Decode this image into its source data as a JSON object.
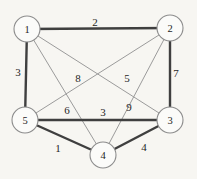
{
  "colors": {
    "background": "#f7f6f2",
    "node_fill": "#fbfbf9",
    "node_stroke": "#8c8c8c",
    "edge_thick": "#3f3f3f",
    "edge_thin": "#9b9b9b",
    "label_text": "#1f1f1f"
  },
  "diagram": {
    "type": "weighted-undirected-graph",
    "node_radius": 13,
    "node_stroke_width": 1.1,
    "node_label_font_size": 10.5,
    "weight_label_font_size": 11,
    "edge_styles": {
      "thick": {
        "color": "#3f3f3f",
        "width": 2.4
      },
      "thin": {
        "color": "#9b9b9b",
        "width": 1
      }
    },
    "nodes": [
      {
        "id": "1",
        "x": 27,
        "y": 29
      },
      {
        "id": "2",
        "x": 170,
        "y": 28
      },
      {
        "id": "5",
        "x": 25,
        "y": 120
      },
      {
        "id": "3",
        "x": 170,
        "y": 120
      },
      {
        "id": "4",
        "x": 103,
        "y": 155
      }
    ],
    "edges": [
      {
        "from": "2",
        "to": "5",
        "weight": "8",
        "style": "thin",
        "label_x": 78,
        "label_y": 78
      },
      {
        "from": "1",
        "to": "3",
        "weight": "5",
        "style": "thin",
        "label_x": 127,
        "label_y": 78
      },
      {
        "from": "1",
        "to": "4",
        "weight": "6",
        "style": "thin",
        "label_x": 67,
        "label_y": 110
      },
      {
        "from": "2",
        "to": "4",
        "weight": "9",
        "style": "thin",
        "label_x": 129,
        "label_y": 107
      },
      {
        "from": "1",
        "to": "2",
        "weight": "2",
        "style": "thick",
        "label_x": 95,
        "label_y": 22
      },
      {
        "from": "1",
        "to": "5",
        "weight": "3",
        "style": "thick",
        "label_x": 18,
        "label_y": 72
      },
      {
        "from": "2",
        "to": "3",
        "weight": "7",
        "style": "thick",
        "label_x": 176,
        "label_y": 73
      },
      {
        "from": "5",
        "to": "3",
        "weight": "3",
        "style": "thick",
        "label_x": 103,
        "label_y": 112
      },
      {
        "from": "5",
        "to": "4",
        "weight": "1",
        "style": "thick",
        "label_x": 58,
        "label_y": 148
      },
      {
        "from": "4",
        "to": "3",
        "weight": "4",
        "style": "thick",
        "label_x": 144,
        "label_y": 147
      }
    ]
  }
}
